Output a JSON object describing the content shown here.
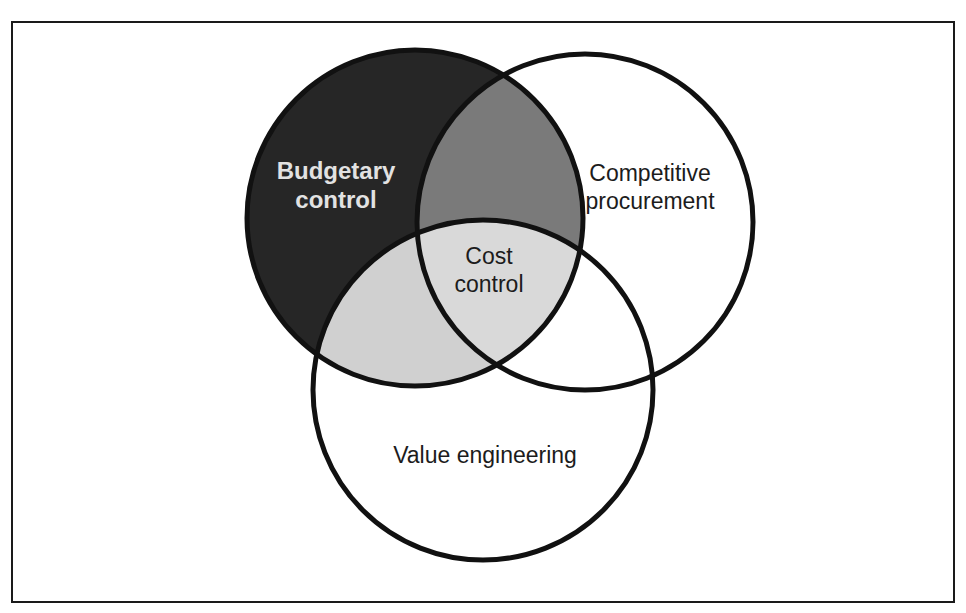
{
  "diagram": {
    "type": "venn",
    "colors": {
      "budgetary_only": "#262626",
      "budgetary_competitive": "#7a7a7a",
      "budgetary_value": "#d0d0d0",
      "center": "#d9d9d9",
      "background": "#ffffff",
      "outline": "#111111"
    },
    "sets": [
      {
        "id": "budgetary",
        "label_line1": "Budgetary",
        "label_line2": "control"
      },
      {
        "id": "competitive",
        "label_line1": "Competitive",
        "label_line2": "procurement"
      },
      {
        "id": "value",
        "label_line1": "Value engineering"
      }
    ],
    "center": {
      "label_line1": "Cost",
      "label_line2": "control"
    }
  }
}
